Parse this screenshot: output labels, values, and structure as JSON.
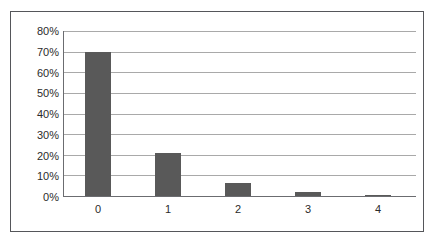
{
  "chart_data": {
    "type": "bar",
    "title": "",
    "subtitle": "",
    "xlabel": "",
    "ylabel": "",
    "categories": [
      "0",
      "1",
      "2",
      "3",
      "4"
    ],
    "values": [
      70,
      21,
      6.5,
      2,
      0.5
    ],
    "value_labels": [
      "70%",
      "21%",
      "6.5%",
      "2%",
      "0.5%"
    ],
    "ylim": [
      0,
      80
    ],
    "ytick_values": [
      0,
      10,
      20,
      30,
      40,
      50,
      60,
      70,
      80
    ],
    "ytick_labels": [
      "0%",
      "10%",
      "20%",
      "30%",
      "40%",
      "50%",
      "60%",
      "70%",
      "80%"
    ],
    "grid": true,
    "grid_axis": "y",
    "legend": false,
    "legend_position": "none",
    "series": [
      {
        "name": "",
        "values": [
          70,
          21,
          6.5,
          2,
          0.5
        ]
      }
    ],
    "colors": {
      "bar": "#595959",
      "gridline": "#a9a9a9",
      "axis": "#6b6c70",
      "frame": "#55565a",
      "background": "#ffffff",
      "text": "#2b2b2b"
    }
  }
}
